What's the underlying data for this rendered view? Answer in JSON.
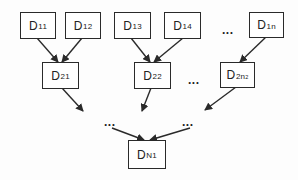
{
  "diagram": {
    "type": "hierarchical-merge-tree",
    "level1": [
      {
        "id": "D11",
        "base": "D",
        "sub": "11"
      },
      {
        "id": "D12",
        "base": "D",
        "sub": "12"
      },
      {
        "id": "D13",
        "base": "D",
        "sub": "13"
      },
      {
        "id": "D14",
        "base": "D",
        "sub": "14"
      },
      {
        "id": "D1n",
        "base": "D",
        "sub": "1n"
      }
    ],
    "level2": [
      {
        "id": "D21",
        "base": "D",
        "sub": "21"
      },
      {
        "id": "D22",
        "base": "D",
        "sub": "22"
      },
      {
        "id": "D2n2",
        "base": "D",
        "sub": "2n",
        "subsub": "2"
      }
    ],
    "root": {
      "id": "DN1",
      "base": "D",
      "sub": "N1"
    },
    "ellipsis": "...",
    "edges": [
      [
        "D11",
        "D21"
      ],
      [
        "D12",
        "D21"
      ],
      [
        "D13",
        "D22"
      ],
      [
        "D14",
        "D22"
      ],
      [
        "D1n",
        "D2n2"
      ],
      [
        "D21",
        "..."
      ],
      [
        "D22",
        "..."
      ],
      [
        "D2n2",
        "..."
      ],
      [
        "...",
        "DN1"
      ],
      [
        "...",
        "DN1"
      ]
    ],
    "colors": {
      "stroke": "#2a2a2a",
      "background": "#ffffff",
      "text": "#222222"
    }
  }
}
